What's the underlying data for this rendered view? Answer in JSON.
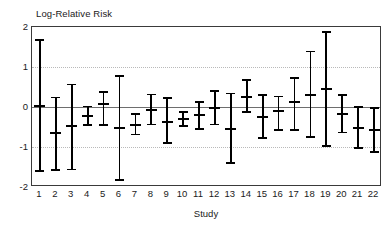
{
  "chart_data": {
    "type": "scatter",
    "title": "",
    "ylabel": "Log-Relative Risk",
    "xlabel": "Study",
    "ylim": [
      -2,
      2
    ],
    "yticks": [
      2,
      1,
      0,
      -1,
      -2
    ],
    "ytick_labels": [
      "2",
      "1",
      "0",
      "-1",
      "-2"
    ],
    "gridlines": [
      1,
      -1
    ],
    "zero_reference_line": 0,
    "grid": true,
    "legend": "none",
    "categories": [
      "1",
      "2",
      "3",
      "4",
      "5",
      "6",
      "7",
      "8",
      "9",
      "10",
      "11",
      "12",
      "13",
      "14",
      "15",
      "16",
      "17",
      "18",
      "19",
      "20",
      "21",
      "22"
    ],
    "series": [
      {
        "name": "Log-Relative Risk estimate with 95% CI",
        "estimates": [
          0.03,
          -0.65,
          -0.47,
          -0.22,
          0.07,
          -0.52,
          -0.44,
          -0.07,
          -0.38,
          -0.3,
          -0.2,
          -0.03,
          -0.55,
          0.26,
          -0.26,
          -0.1,
          0.13,
          0.31,
          0.44,
          -0.18,
          -0.53,
          -0.57
        ],
        "lower_ci": [
          -1.6,
          -1.58,
          -1.56,
          -0.45,
          -0.45,
          -1.82,
          -0.69,
          -0.44,
          -0.9,
          -0.48,
          -0.55,
          -0.44,
          -1.4,
          -0.12,
          -0.78,
          -0.58,
          -0.58,
          -0.75,
          -0.97,
          -0.64,
          -1.02,
          -1.12
        ],
        "upper_ci": [
          1.67,
          0.24,
          0.56,
          0.01,
          0.38,
          0.77,
          -0.18,
          0.31,
          0.22,
          -0.13,
          0.13,
          0.4,
          0.34,
          0.67,
          0.3,
          0.26,
          0.72,
          1.39,
          1.88,
          0.3,
          0.0,
          -0.02
        ]
      }
    ]
  },
  "axes": {
    "y_title": "Log-Relative Risk",
    "x_title": "Study"
  },
  "colors": {
    "bar": "#000000",
    "frame": "#3a3a3a",
    "gridline": "#b9b9b9",
    "zeroline": "#6e6e6e",
    "background": "#ffffff",
    "text": "#1a1a1a"
  }
}
